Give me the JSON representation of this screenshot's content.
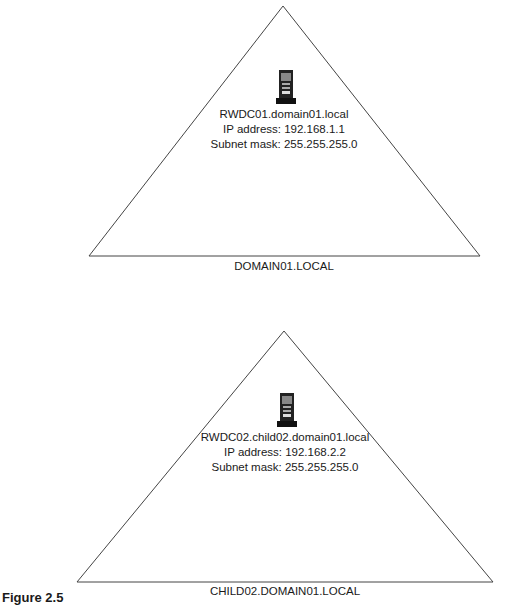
{
  "diagram": {
    "domains": [
      {
        "name": "DOMAIN01.LOCAL",
        "server": {
          "icon": "server-icon",
          "hostname": "RWDC01.domain01.local",
          "ip": "IP address: 192.168.1.1",
          "subnet": "Subnet mask: 255.255.255.0"
        }
      },
      {
        "name": "CHILD02.DOMAIN01.LOCAL",
        "server": {
          "icon": "server-icon",
          "hostname": "RWDC02.child02.domain01.local",
          "ip": "IP address: 192.168.2.2",
          "subnet": "Subnet mask: 255.255.255.0"
        }
      }
    ],
    "caption": "Figure 2.5"
  }
}
